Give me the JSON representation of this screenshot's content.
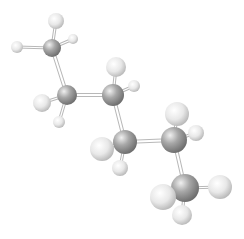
{
  "molecule": {
    "name": "hexane",
    "formula": "C6H14",
    "style": "ball-and-stick",
    "colors": {
      "background": "#ffffff",
      "carbon_light": "#e6e6e6",
      "carbon_mid": "#a8a8a8",
      "carbon_dark": "#6e6e6e",
      "hydrogen_light": "#ffffff",
      "hydrogen_mid": "#e8e8e8",
      "hydrogen_dark": "#b4b4b4",
      "bond": "#b8b8b8"
    },
    "atoms": [
      {
        "id": "C1",
        "element": "C",
        "x": 52,
        "y": 48,
        "r": 9
      },
      {
        "id": "C2",
        "element": "C",
        "x": 67,
        "y": 95,
        "r": 10
      },
      {
        "id": "C3",
        "element": "C",
        "x": 113,
        "y": 95,
        "r": 11
      },
      {
        "id": "C4",
        "element": "C",
        "x": 125,
        "y": 142,
        "r": 12
      },
      {
        "id": "C5",
        "element": "C",
        "x": 174,
        "y": 140,
        "r": 13
      },
      {
        "id": "C6",
        "element": "C",
        "x": 185,
        "y": 188,
        "r": 14
      },
      {
        "id": "H1a",
        "element": "H",
        "x": 56,
        "y": 21,
        "r": 8
      },
      {
        "id": "H1b",
        "element": "H",
        "x": 17,
        "y": 47,
        "r": 6
      },
      {
        "id": "H1c",
        "element": "H",
        "x": 73,
        "y": 39,
        "r": 5
      },
      {
        "id": "H2a",
        "element": "H",
        "x": 42,
        "y": 103,
        "r": 9
      },
      {
        "id": "H2b",
        "element": "H",
        "x": 59,
        "y": 122,
        "r": 6
      },
      {
        "id": "H3a",
        "element": "H",
        "x": 116,
        "y": 67,
        "r": 10
      },
      {
        "id": "H3b",
        "element": "H",
        "x": 134,
        "y": 86,
        "r": 6
      },
      {
        "id": "H4a",
        "element": "H",
        "x": 102,
        "y": 149,
        "r": 12
      },
      {
        "id": "H4b",
        "element": "H",
        "x": 120,
        "y": 168,
        "r": 8
      },
      {
        "id": "H5a",
        "element": "H",
        "x": 177,
        "y": 114,
        "r": 12
      },
      {
        "id": "H5b",
        "element": "H",
        "x": 196,
        "y": 133,
        "r": 8
      },
      {
        "id": "H6a",
        "element": "H",
        "x": 163,
        "y": 197,
        "r": 13
      },
      {
        "id": "H6b",
        "element": "H",
        "x": 220,
        "y": 187,
        "r": 12
      },
      {
        "id": "H6c",
        "element": "H",
        "x": 182,
        "y": 215,
        "r": 10
      }
    ],
    "bonds": [
      [
        "C1",
        "C2"
      ],
      [
        "C2",
        "C3"
      ],
      [
        "C3",
        "C4"
      ],
      [
        "C4",
        "C5"
      ],
      [
        "C5",
        "C6"
      ],
      [
        "C1",
        "H1a"
      ],
      [
        "C1",
        "H1b"
      ],
      [
        "C1",
        "H1c"
      ],
      [
        "C2",
        "H2a"
      ],
      [
        "C2",
        "H2b"
      ],
      [
        "C3",
        "H3a"
      ],
      [
        "C3",
        "H3b"
      ],
      [
        "C4",
        "H4a"
      ],
      [
        "C4",
        "H4b"
      ],
      [
        "C5",
        "H5a"
      ],
      [
        "C5",
        "H5b"
      ],
      [
        "C6",
        "H6a"
      ],
      [
        "C6",
        "H6b"
      ],
      [
        "C6",
        "H6c"
      ]
    ],
    "draw_order": [
      "H1a",
      "H1c",
      "C1",
      "H1b",
      "H3a",
      "H3b",
      "C2",
      "H2b",
      "C3",
      "H2a",
      "H5a",
      "H5b",
      "H4b",
      "C4",
      "C5",
      "H4a",
      "H6c",
      "C6",
      "H6a",
      "H6b"
    ]
  }
}
